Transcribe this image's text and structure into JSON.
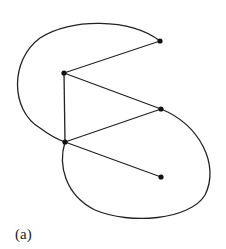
{
  "figure": {
    "caption": "(a)",
    "stroke_color": "#222222",
    "node_color": "#111111",
    "node_radius": 2.6,
    "nodes": [
      {
        "id": "v1",
        "x": 160,
        "y": 41
      },
      {
        "id": "v2",
        "x": 64,
        "y": 73
      },
      {
        "id": "v3",
        "x": 161,
        "y": 109
      },
      {
        "id": "v4",
        "x": 65,
        "y": 142
      },
      {
        "id": "v5",
        "x": 161,
        "y": 177
      }
    ],
    "edges": [
      {
        "from": "v2",
        "to": "v1",
        "type": "line"
      },
      {
        "from": "v2",
        "to": "v3",
        "type": "line"
      },
      {
        "from": "v2",
        "to": "v4",
        "type": "line"
      },
      {
        "from": "v4",
        "to": "v3",
        "type": "line"
      },
      {
        "from": "v4",
        "to": "v5",
        "type": "line"
      },
      {
        "from": "v1",
        "to": "v4",
        "type": "curve",
        "path": "M160,41 C130,18 70,18 40,38 C10,60 10,110 40,128 C48,134 56,139 65,142"
      },
      {
        "from": "v3",
        "to": "v4",
        "type": "curve",
        "path": "M161,109 C200,125 220,165 205,195 C190,220 130,225 95,210 C65,195 58,165 65,142"
      }
    ]
  }
}
